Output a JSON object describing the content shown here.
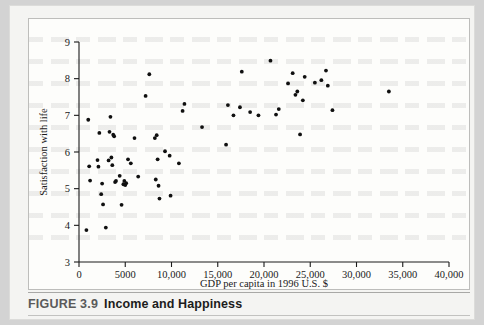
{
  "figure": {
    "caption_number": "FIGURE 3.9",
    "caption_title": "Income and Happiness"
  },
  "chart_data": {
    "type": "scatter",
    "title": "Income and Happiness",
    "xlabel": "GDP per capita in 1996 U.S. $",
    "ylabel": "Satisfaction with life",
    "xlim": [
      0,
      40000
    ],
    "ylim": [
      3,
      9
    ],
    "xticks": [
      0,
      5000,
      10000,
      15000,
      20000,
      25000,
      30000,
      35000,
      40000
    ],
    "xtick_labels": [
      "0",
      "5000",
      "10,000",
      "15,000",
      "20,000",
      "25,000",
      "30,000",
      "35,000",
      "40,000"
    ],
    "yticks": [
      3,
      4,
      5,
      6,
      7,
      8,
      9
    ],
    "ytick_labels": [
      "3",
      "4",
      "5",
      "6",
      "7",
      "8",
      "9"
    ],
    "grid": false,
    "legend": null,
    "marker": "filled-circle",
    "marker_color": "#101010",
    "points": [
      [
        800,
        3.87
      ],
      [
        1000,
        6.88
      ],
      [
        1100,
        5.61
      ],
      [
        1200,
        5.22
      ],
      [
        2000,
        5.78
      ],
      [
        2100,
        5.6
      ],
      [
        2200,
        6.52
      ],
      [
        2400,
        4.85
      ],
      [
        2500,
        5.14
      ],
      [
        2600,
        4.57
      ],
      [
        2900,
        3.94
      ],
      [
        3200,
        5.77
      ],
      [
        3300,
        6.55
      ],
      [
        3400,
        6.96
      ],
      [
        3500,
        5.85
      ],
      [
        3600,
        5.64
      ],
      [
        3700,
        6.47
      ],
      [
        3800,
        6.43
      ],
      [
        3900,
        5.18
      ],
      [
        4000,
        5.21
      ],
      [
        4400,
        5.35
      ],
      [
        4600,
        4.56
      ],
      [
        4800,
        5.12
      ],
      [
        4900,
        5.21
      ],
      [
        5000,
        5.1
      ],
      [
        5100,
        5.15
      ],
      [
        5300,
        5.8
      ],
      [
        5600,
        5.69
      ],
      [
        6000,
        6.38
      ],
      [
        6400,
        5.33
      ],
      [
        7200,
        7.53
      ],
      [
        7600,
        8.12
      ],
      [
        8200,
        6.38
      ],
      [
        8300,
        5.25
      ],
      [
        8400,
        6.46
      ],
      [
        8500,
        5.8
      ],
      [
        8600,
        5.08
      ],
      [
        8700,
        4.73
      ],
      [
        9300,
        6.02
      ],
      [
        9800,
        5.9
      ],
      [
        9900,
        4.81
      ],
      [
        10800,
        5.69
      ],
      [
        11200,
        7.12
      ],
      [
        11400,
        7.31
      ],
      [
        13300,
        6.68
      ],
      [
        15900,
        6.2
      ],
      [
        16100,
        7.28
      ],
      [
        16700,
        7.0
      ],
      [
        17400,
        7.22
      ],
      [
        17600,
        8.19
      ],
      [
        18500,
        7.09
      ],
      [
        19400,
        7.0
      ],
      [
        20700,
        8.49
      ],
      [
        21300,
        7.02
      ],
      [
        21600,
        7.17
      ],
      [
        22600,
        7.87
      ],
      [
        23100,
        8.15
      ],
      [
        23400,
        7.56
      ],
      [
        23600,
        7.65
      ],
      [
        23900,
        6.48
      ],
      [
        24200,
        7.41
      ],
      [
        24400,
        8.05
      ],
      [
        25500,
        7.89
      ],
      [
        26200,
        7.96
      ],
      [
        26700,
        8.22
      ],
      [
        26900,
        7.81
      ],
      [
        27400,
        7.14
      ],
      [
        33500,
        7.65
      ]
    ]
  }
}
